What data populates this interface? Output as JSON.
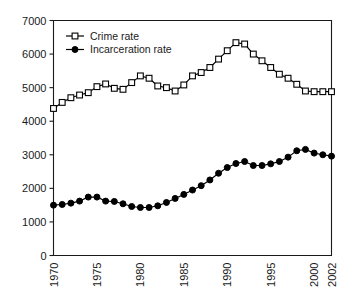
{
  "chart_data": {
    "type": "line",
    "title": "",
    "xlabel": "",
    "ylabel": "",
    "ylim": [
      0,
      7000
    ],
    "xlim": [
      1970,
      2002
    ],
    "grid": false,
    "legend_position": "top-left",
    "yticks": [
      "0",
      "1000",
      "2000",
      "3000",
      "4000",
      "5000",
      "6000",
      "7000"
    ],
    "ytick_values": [
      0,
      1000,
      2000,
      3000,
      4000,
      5000,
      6000,
      7000
    ],
    "xticks": [
      "1970",
      "1975",
      "1980",
      "1985",
      "1990",
      "1995",
      "2000",
      "2002"
    ],
    "xtick_values": [
      1970,
      1975,
      1980,
      1985,
      1990,
      1995,
      2000,
      2002
    ],
    "x": [
      1970,
      1971,
      1972,
      1973,
      1974,
      1975,
      1976,
      1977,
      1978,
      1979,
      1980,
      1981,
      1982,
      1983,
      1984,
      1985,
      1986,
      1987,
      1988,
      1989,
      1990,
      1991,
      1992,
      1993,
      1994,
      1995,
      1996,
      1997,
      1998,
      1999,
      2000,
      2001,
      2002
    ],
    "series": [
      {
        "name": "Crime rate",
        "marker": "open-square",
        "values": [
          4380,
          4560,
          4700,
          4780,
          4850,
          5030,
          5110,
          4980,
          4950,
          5150,
          5350,
          5280,
          5050,
          5000,
          4900,
          5080,
          5350,
          5450,
          5600,
          5850,
          6100,
          6340,
          6300,
          6000,
          5800,
          5600,
          5400,
          5280,
          5100,
          4900,
          4880,
          4880,
          4880
        ]
      },
      {
        "name": "Incarceration rate",
        "marker": "filled-circle",
        "values": [
          1500,
          1520,
          1560,
          1620,
          1740,
          1740,
          1620,
          1610,
          1540,
          1460,
          1430,
          1430,
          1480,
          1580,
          1700,
          1820,
          1950,
          2080,
          2250,
          2450,
          2620,
          2740,
          2800,
          2680,
          2680,
          2730,
          2800,
          2930,
          3120,
          3160,
          3050,
          3000,
          2960
        ]
      }
    ]
  },
  "legend": {
    "entries": [
      {
        "label": "Crime rate",
        "marker": "open-square"
      },
      {
        "label": "Incarceration rate",
        "marker": "filled-circle"
      }
    ]
  }
}
